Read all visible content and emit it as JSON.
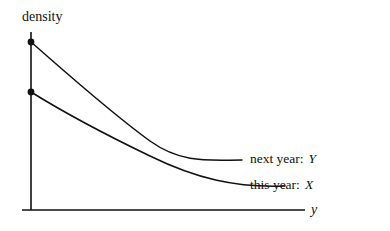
{
  "figure": {
    "background_color": "#ffffff",
    "ink_color": "#111111",
    "width": 390,
    "height": 231
  },
  "axes": {
    "y_axis_title": "density",
    "x_axis_title": "y",
    "origin_x": 31,
    "origin_y": 210,
    "y_axis_top": 32,
    "x_axis_right": 305,
    "tick_left_extent": 22
  },
  "labels": {
    "next_year": {
      "text": "next year:",
      "variable": "Y"
    },
    "this_year": {
      "text": "this year:",
      "variable": "X"
    }
  },
  "chart_data": {
    "type": "line",
    "title": "",
    "xlabel": "y",
    "ylabel": "density",
    "grid": false,
    "legend_position": "inline-right-of-curves",
    "axis_style": "open L-shaped axes, no tick labels",
    "xlim": [
      0,
      1
    ],
    "ylim": [
      0,
      1
    ],
    "annotations": [
      {
        "text": "next year: Y",
        "attached_to": "next year: Y",
        "x": 0.77,
        "y": 0.3
      },
      {
        "text": "this year: X",
        "attached_to": "this year: X",
        "x": 0.93,
        "y": 0.14
      }
    ],
    "series": [
      {
        "name": "next year: Y",
        "label": "next year: Y",
        "marker_at_intercept": true,
        "intercept_y": 0.94,
        "svg_path": "M31,42 C70,76 110,112 150,141 C182,164 210,160 242,160",
        "points": [
          {
            "x": 0.0,
            "y": 0.94
          },
          {
            "x": 0.1,
            "y": 0.78
          },
          {
            "x": 0.2,
            "y": 0.63
          },
          {
            "x": 0.3,
            "y": 0.51
          },
          {
            "x": 0.4,
            "y": 0.42
          },
          {
            "x": 0.5,
            "y": 0.35
          },
          {
            "x": 0.6,
            "y": 0.31
          },
          {
            "x": 0.7,
            "y": 0.29
          },
          {
            "x": 0.8,
            "y": 0.28
          },
          {
            "x": 0.9,
            "y": 0.28
          },
          {
            "x": 1.0,
            "y": 0.28
          }
        ]
      },
      {
        "name": "this year: X",
        "label": "this year: X",
        "marker_at_intercept": true,
        "intercept_y": 0.66,
        "svg_path": "M31,92 C60,110 100,132 150,156 C195,178 235,188 285,186",
        "points": [
          {
            "x": 0.0,
            "y": 0.66
          },
          {
            "x": 0.1,
            "y": 0.59
          },
          {
            "x": 0.2,
            "y": 0.52
          },
          {
            "x": 0.3,
            "y": 0.45
          },
          {
            "x": 0.4,
            "y": 0.39
          },
          {
            "x": 0.5,
            "y": 0.33
          },
          {
            "x": 0.6,
            "y": 0.27
          },
          {
            "x": 0.7,
            "y": 0.22
          },
          {
            "x": 0.8,
            "y": 0.17
          },
          {
            "x": 0.9,
            "y": 0.14
          },
          {
            "x": 1.0,
            "y": 0.13
          }
        ]
      }
    ],
    "crossing_point": {
      "x": 0.43,
      "y": 0.38
    },
    "markers": [
      {
        "series": "next year: Y",
        "x": 0.0,
        "y": 0.94,
        "px": 31,
        "py": 42,
        "radius": 3.4
      },
      {
        "series": "this year: X",
        "x": 0.0,
        "y": 0.66,
        "px": 31,
        "py": 92,
        "radius": 3.4
      }
    ]
  }
}
